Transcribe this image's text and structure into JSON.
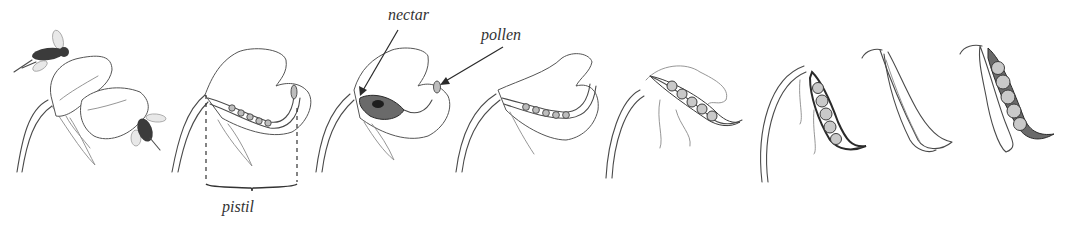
{
  "figure": {
    "stage_count": 8,
    "stages": [
      {
        "index": 1,
        "description": "open pea flower visited by bees"
      },
      {
        "index": 2,
        "description": "flower cutaway showing pistil with ovules"
      },
      {
        "index": 3,
        "description": "flower cutaway showing nectar and pollen"
      },
      {
        "index": 4,
        "description": "fertilized ovary elongating, petals wilting"
      },
      {
        "index": 5,
        "description": "young pod with developing peas, petals withering"
      },
      {
        "index": 6,
        "description": "pod with swelling peas hanging from stem"
      },
      {
        "index": 7,
        "description": "mature closed pea pod"
      },
      {
        "index": 8,
        "description": "opened pea pod showing peas"
      }
    ]
  },
  "labels": {
    "nectar": "nectar",
    "pollen": "pollen",
    "pistil": "pistil"
  },
  "colors": {
    "ink": "#4a4a4a",
    "pea_fill": "#c9c9c9",
    "background": "#ffffff"
  }
}
